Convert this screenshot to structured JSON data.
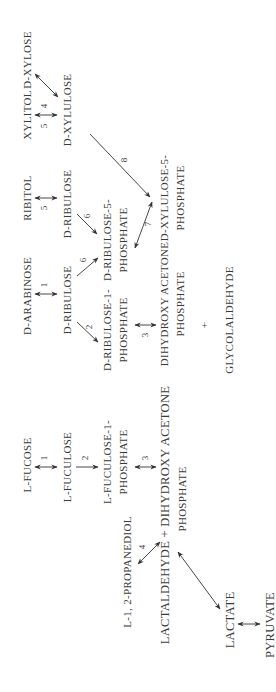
{
  "diagram": {
    "orientation": "rotated-90-ccw",
    "colors": {
      "text": "#3a3a3a",
      "arrow": "#333333",
      "background": "#ffffff"
    },
    "compounds": {
      "d_xylose": "D-XYLOSE",
      "xylitol": "XYLITOL",
      "d_xylulose": "D-XYLULOSE",
      "ribitol": "RIBITOL",
      "d_ribulose_right": "D-RIBULOSE",
      "d_ribulose_5p_line1": "D-RIBULOSE-5-",
      "d_ribulose_5p_line2": "PHOSPHATE",
      "d_xylulose_5p_line1": "D-XYLULOSE-5-",
      "d_xylulose_5p_line2": "PHOSPHATE",
      "d_arabinose": "D-ARABINOSE",
      "d_ribulose_left": "D-RIBULOSE",
      "d_ribulose_1p_line1": "D-RIBULOSE-1-",
      "d_ribulose_1p_line2": "PHOSPHATE",
      "dhap_mid_line1": "DIHYDROXY ACETONE",
      "dhap_mid_line2": "PHOSPHATE",
      "plus": "+",
      "glycolaldehyde": "GLYCOLALDEHYDE",
      "l_fucose": "L-FUCOSE",
      "l_fuculose": "L-FUCULOSE",
      "l_fuculose_1p_line1": "L-FUCULOSE-1-",
      "l_fuculose_1p_line2": "PHOSPHATE",
      "lactaldehyde_dhap_line1": "LACTALDEHYDE + DIHYDROXY ACETONE",
      "lactaldehyde_dhap_line2": "PHOSPHATE",
      "propanediol": "L-1, 2-PROPANEDIOL",
      "lactate": "LACTATE",
      "pyruvate": "PYRUVATE"
    },
    "step_numbers": {
      "xylose_xylulose_4": "4",
      "xylitol_xylulose_5": "5",
      "ribitol_ribulose_5": "5",
      "ribulose_r5p_6": "6",
      "xylulose_xu5p_8": "8",
      "r5p_xu5p_7": "7",
      "arabinose_ribulose_1": "1",
      "ribulose_r5p_left_6": "6",
      "ribulose_r1p_2": "2",
      "r1p_dhap_3": "3",
      "fucose_fuculose_1": "1",
      "fuculose_f1p_2": "2",
      "f1p_dhap_3": "3",
      "lactaldehyde_propanediol_4": "4"
    }
  }
}
